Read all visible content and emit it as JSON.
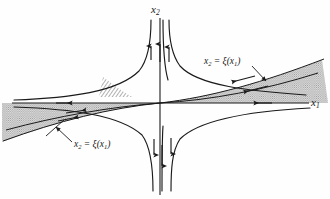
{
  "figure": {
    "kind": "phase-portrait-saddle-point",
    "background_color": "#fefefe",
    "ink_color": "#1a1a1a",
    "shade_color": "#9a9a9a",
    "width": 330,
    "height": 199
  },
  "axes": {
    "origin": {
      "x": 160,
      "y": 103
    },
    "vertical": {
      "name": "x2",
      "label_html": "x<sub>2</sub>",
      "label_text": "x2",
      "x": 160,
      "y_top": 18,
      "y_bottom": 195
    },
    "horizontal": {
      "name": "x1",
      "label_html": "x<sub>1</sub>",
      "label_text": "x1",
      "y": 103,
      "x_left": 12,
      "x_right": 309
    }
  },
  "annotations": [
    {
      "id": "curve-label-upper",
      "text": "x2 = ξ(x1)",
      "html": "x<sub>2</sub> = &#958;(x<sub>1</sub>)",
      "position": {
        "x": 204,
        "y": 57
      },
      "leader_from": {
        "x": 253,
        "y": 68
      },
      "leader_to": {
        "x": 268,
        "y": 82
      }
    },
    {
      "id": "curve-label-lower",
      "text": "x2 = ξ(x1)",
      "html": "x<sub>2</sub> = &#958;(x<sub>1</sub>)",
      "position": {
        "x": 74,
        "y": 140
      },
      "leader_from": {
        "x": 72,
        "y": 143
      },
      "leader_to": {
        "x": 56,
        "y": 128
      }
    }
  ],
  "chart_data": {
    "type": "line",
    "title": "",
    "xlabel": "x1",
    "ylabel": "x2",
    "grid": false,
    "legend": "none",
    "flow_arrows": [
      {
        "on": "upper-left-branch",
        "direction": "up",
        "x": 150,
        "y": 52
      },
      {
        "on": "upper-center-branch",
        "direction": "up",
        "x": 159,
        "y": 48
      },
      {
        "on": "upper-right-branch",
        "direction": "up",
        "x": 170,
        "y": 53
      },
      {
        "on": "lower-left-branch",
        "direction": "down",
        "x": 155,
        "y": 153
      },
      {
        "on": "lower-center-branch",
        "direction": "down",
        "x": 162,
        "y": 163
      },
      {
        "on": "lower-right-branch",
        "direction": "down",
        "x": 172,
        "y": 152
      },
      {
        "on": "x1-axis-left",
        "direction": "right",
        "x": 66,
        "y": 103
      },
      {
        "on": "x1-axis-right",
        "direction": "left",
        "x": 258,
        "y": 103
      },
      {
        "on": "left-sector-upper",
        "direction": "right",
        "x": 82,
        "y": 110
      },
      {
        "on": "left-sector-lower",
        "direction": "right",
        "x": 74,
        "y": 117
      },
      {
        "on": "right-sector-upper",
        "direction": "left",
        "x": 235,
        "y": 80
      },
      {
        "on": "right-sector-lower",
        "direction": "left",
        "x": 247,
        "y": 90
      }
    ],
    "series": [
      {
        "name": "upper-left-hyperbola",
        "role": "trajectory",
        "path": "M 14,101 C 70,99 118,92 140,70 C 150,58 152,38 152,20"
      },
      {
        "name": "upper-right-hyperbola",
        "role": "trajectory",
        "path": "M 306,96 C 250,92 198,86 180,66 C 171,54 169,36 169,20"
      },
      {
        "name": "lower-left-hyperbola",
        "role": "trajectory",
        "path": "M 14,106 C 72,108 120,114 142,134 C 151,146 153,166 153,190"
      },
      {
        "name": "lower-right-hyperbola",
        "role": "trajectory",
        "path": "M 310,107 C 252,110 200,118 180,138 C 172,150 171,168 171,190"
      },
      {
        "name": "upper-sector-boundary-right",
        "role": "xi-curve",
        "path": "M 160,103 C 210,97 262,82 322,60"
      },
      {
        "name": "upper-sector-inner-right",
        "role": "xi-curve",
        "path": "M 160,103 C 212,99 264,89 318,72"
      },
      {
        "name": "lower-sector-boundary-left",
        "role": "xi-curve",
        "path": "M 160,103 C 112,109 60,122 6,142"
      },
      {
        "name": "lower-sector-inner-left",
        "role": "xi-curve",
        "path": "M 160,103 C 110,107 58,116 8,131"
      }
    ],
    "shaded_sectors": [
      {
        "name": "right-wedge",
        "fill": "#a0a0a0",
        "opacity": 0.55,
        "path": "M 160,103 C 212,97 264,82 322,60 L 326,103 Z"
      },
      {
        "name": "left-wedge",
        "fill": "#a0a0a0",
        "opacity": 0.55,
        "path": "M 160,103 C 110,108 58,121 4,141 L 4,103 Z"
      },
      {
        "name": "center-hatch-sliver",
        "fill": "hatch",
        "path": "M 104,78 L 130,97 L 100,97 Z"
      }
    ]
  }
}
